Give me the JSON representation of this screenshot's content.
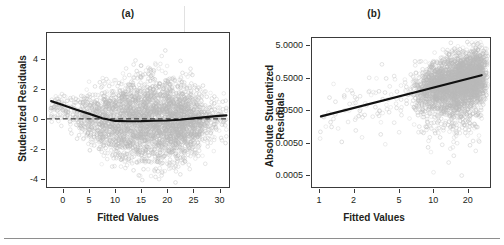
{
  "figure": {
    "footer_rule": true,
    "artifact_note": "vertical scan streak near x=23 in panel (a)"
  },
  "panels": [
    {
      "id": "a",
      "title": "(a)",
      "xlabel": "Fitted Values",
      "ylabel": "Studentized Residuals"
    },
    {
      "id": "b",
      "title": "(b)",
      "xlabel": "Fitted Values",
      "ylabel_line1": "Absolute Studentized",
      "ylabel_line2": "Residuals"
    }
  ],
  "chart_data": [
    {
      "type": "scatter",
      "title": "(a)",
      "xlabel": "Fitted Values",
      "ylabel": "Studentized Residuals",
      "xscale": "linear",
      "yscale": "linear",
      "xlim": [
        -3.2,
        32.0
      ],
      "ylim": [
        -4.6,
        5.8
      ],
      "xticks": [
        0,
        5,
        10,
        15,
        20,
        25,
        30
      ],
      "xticklabels": [
        "0",
        "5",
        "10",
        "15",
        "20",
        "25",
        "30"
      ],
      "yticks": [
        -4,
        -2,
        0,
        2,
        4
      ],
      "yticklabels": [
        "-4",
        "-2",
        "0",
        "2",
        "4"
      ],
      "grid": false,
      "legend": "none",
      "marker": "open-circle",
      "marker_color": "#bdbdbd",
      "point_count_approx": 4000,
      "cloud_description": "Dense gray residual cloud widening from x=5 to x=25, centered near 0, spread roughly -3 to +4, sparse tails beyond x=25.",
      "reference_line": {
        "style": "dashed",
        "color": "#1a1a1a",
        "y": 0
      },
      "smoother": {
        "name": "loess",
        "style": "solid",
        "color": "#111111",
        "width": 2.2,
        "x": [
          -2.4,
          0,
          2.5,
          5,
          7.5,
          10,
          12.5,
          15,
          17.5,
          20,
          22.5,
          25,
          27.5,
          30,
          31.5
        ],
        "y": [
          1.2,
          0.92,
          0.62,
          0.34,
          0.05,
          -0.14,
          -0.16,
          -0.15,
          -0.13,
          -0.11,
          -0.06,
          0.03,
          0.12,
          0.2,
          0.23
        ]
      },
      "annotations": [
        "(a)"
      ]
    },
    {
      "type": "scatter",
      "title": "(b)",
      "xlabel": "Fitted Values",
      "ylabel": "Absolute Studentized Residuals",
      "xscale": "log",
      "yscale": "log",
      "xlim": [
        0.85,
        32.0
      ],
      "ylim": [
        0.0002,
        9.0
      ],
      "xticks": [
        1,
        2,
        5,
        10,
        20
      ],
      "xticklabels": [
        "1",
        "2",
        "5",
        "10",
        "20"
      ],
      "yticks": [
        0.0005,
        0.005,
        0.05,
        0.5,
        5.0
      ],
      "yticklabels": [
        "0.0005",
        "0.0050",
        "0.0500",
        "0.5000",
        "5.0000"
      ],
      "grid": false,
      "legend": "none",
      "marker": "open-circle",
      "marker_color": "#bdbdbd",
      "point_count_approx": 4000,
      "cloud_description": "Log-log cloud concentrated between x=7 and x=27, absolute residuals mostly 0.05 to 5, with a downward fan of small values toward 0.0005; a handful of isolated points near x=1 to x=3.",
      "regression_line": {
        "style": "solid",
        "color": "#111111",
        "width": 2.2,
        "x": [
          1.02,
          27.0
        ],
        "y": [
          0.032,
          0.62
        ]
      },
      "annotations": [
        "(b)"
      ]
    }
  ]
}
